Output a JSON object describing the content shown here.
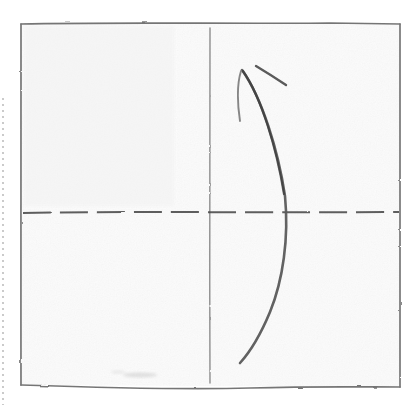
{
  "document": {
    "kind": "scanned-calligraphy-practice-sheet",
    "title": "Calligraphy practice grid with single brush stroke",
    "background_color": "#ffffff",
    "paper_color": "#fafafa"
  },
  "grid": {
    "frame": {
      "label": "practice square frame",
      "color": "#6b6b6b",
      "left": 21,
      "top": 23,
      "right": 400,
      "bottom": 387
    },
    "vertical_center_line": {
      "label": "vertical center guide",
      "color": "#8a8a8a",
      "x": 210,
      "top": 28,
      "bottom": 383,
      "style": "solid"
    },
    "horizontal_center_line": {
      "label": "horizontal center guide",
      "color": "#4a4a4a",
      "y": 212,
      "left": 22,
      "right": 400,
      "style": "dashed",
      "dash_length": 28,
      "gap_length": 9
    }
  },
  "strokes": [
    {
      "name": "main-curved-stroke",
      "description": "long bowed vertical stroke curving right then back left",
      "color": "#5a5a5a",
      "start": [
        242,
        70
      ],
      "widest": [
        286,
        215
      ],
      "end": [
        240,
        363
      ],
      "path": "M 242,70 C 262,98 278,150 285,196 C 289,238 283,280 270,312 C 260,336 250,352 240,363"
    },
    {
      "name": "short-vertical-tick-stroke",
      "description": "thin short vertical hook descending from the top joint",
      "color": "#7a7a7a",
      "start": [
        241,
        70
      ],
      "end": [
        240,
        122
      ],
      "path": "M 241,71 C 237,84 237,101 240,121"
    },
    {
      "name": "short-diagonal-stroke",
      "description": "separate short diagonal dash above right of the joint",
      "color": "#4f4f4f",
      "start": [
        256,
        66
      ],
      "end": [
        286,
        85
      ],
      "path": "M 256,66 C 266,72 277,79 286,85"
    }
  ],
  "marks": [
    {
      "name": "paper-smudge",
      "description": "faint graphite smudge near bottom-left of the grid",
      "x": 140,
      "y": 375
    }
  ],
  "scan_edge": {
    "name": "scan-edge-dotted-line",
    "description": "faint dotted page-edge artifact on the far left",
    "x": 3,
    "top": 98,
    "bottom": 405,
    "color": "#b9b9b9"
  }
}
